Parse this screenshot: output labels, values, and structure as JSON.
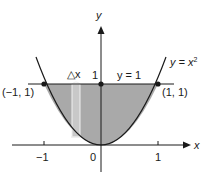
{
  "diagram": {
    "curve_label": "y = x",
    "curve_exponent": "2",
    "line_label": "y = 1",
    "y_axis_label": "y",
    "x_axis_label": "x",
    "y_tick_label": "1",
    "strip_label": "△x",
    "points": [
      {
        "label": "(−1, 1)",
        "x": -1,
        "y": 1
      },
      {
        "label": "(1, 1)",
        "x": 1,
        "y": 1
      },
      {
        "label": "",
        "x": 0,
        "y": 1
      }
    ],
    "x_ticks": [
      {
        "label": "−1",
        "value": -1
      },
      {
        "label": "0",
        "value": 0
      },
      {
        "label": "1",
        "value": 1
      }
    ],
    "colors": {
      "shaded_region": "#a9a9a9",
      "strip_fill": "#c8c8c8",
      "stroke": "#1a1a1a",
      "background": "#ffffff"
    }
  }
}
